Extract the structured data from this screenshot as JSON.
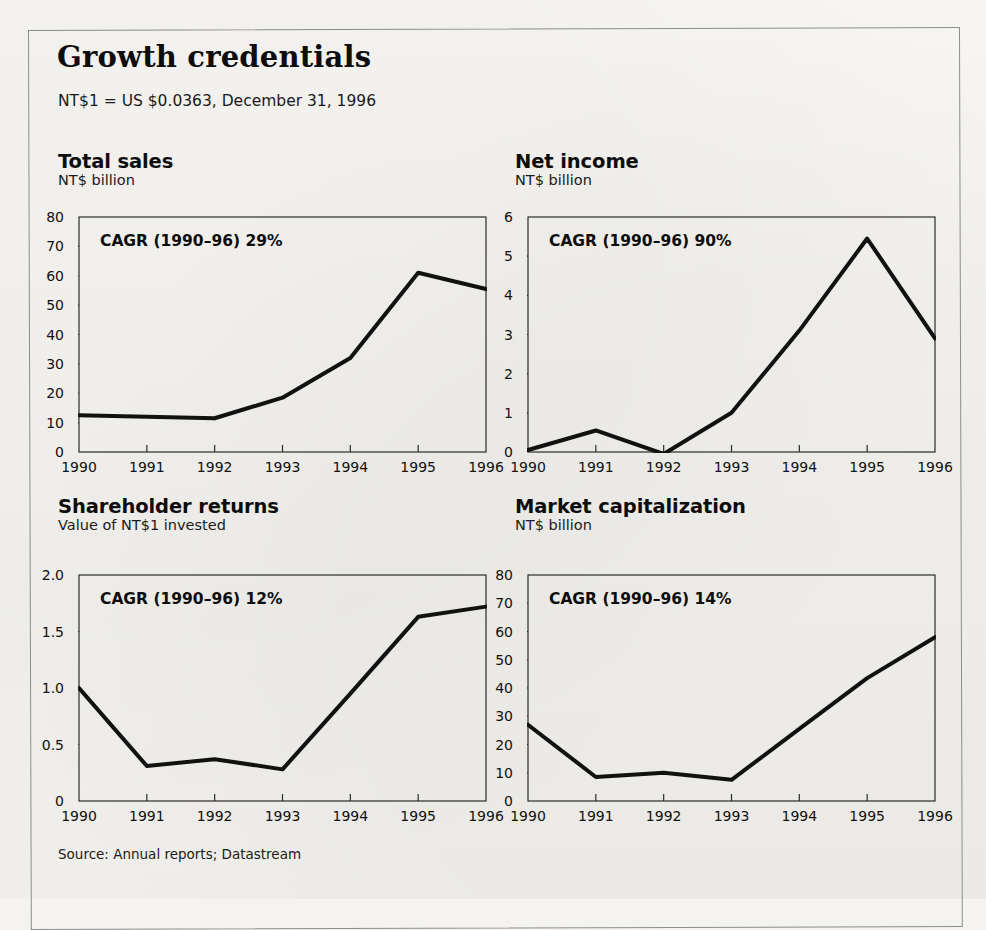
{
  "exhibit": {
    "title": "Growth credentials",
    "note": "NT$1 = US $0.0363, December 31, 1996",
    "source": "Source: Annual reports; Datastream",
    "frame_color": "#8d8d8d",
    "line_color": "#111111",
    "paper_color": "#f4f3f0"
  },
  "chart_data": [
    {
      "type": "line",
      "title": "Total sales",
      "subtitle": "NT$ billion",
      "annotation": "CAGR (1990–96) 29%",
      "xlabel": "",
      "ylabel": "NT$ billion",
      "categories": [
        "1990",
        "1991",
        "1992",
        "1993",
        "1994",
        "1995",
        "1996"
      ],
      "x": [
        1990,
        1991,
        1992,
        1993,
        1994,
        1995,
        1996
      ],
      "values": [
        12.5,
        12.0,
        11.5,
        18.5,
        32.0,
        61.0,
        55.5
      ],
      "ylim": [
        0,
        80
      ],
      "yticks": [
        0,
        10,
        20,
        30,
        40,
        50,
        60,
        70,
        80
      ],
      "ytick_labels": [
        "0",
        "10",
        "20",
        "30",
        "40",
        "50",
        "60",
        "70",
        "80"
      ],
      "grid": false,
      "legend": "none"
    },
    {
      "type": "line",
      "title": "Net income",
      "subtitle": "NT$ billion",
      "annotation": "CAGR (1990–96) 90%",
      "xlabel": "",
      "ylabel": "NT$ billion",
      "categories": [
        "1990",
        "1991",
        "1992",
        "1993",
        "1994",
        "1995",
        "1996"
      ],
      "x": [
        1990,
        1991,
        1992,
        1993,
        1994,
        1995,
        1996
      ],
      "values": [
        0.05,
        0.55,
        -0.05,
        1.0,
        3.1,
        5.45,
        2.9
      ],
      "ylim": [
        0,
        6
      ],
      "yticks": [
        0,
        1,
        2,
        3,
        4,
        5,
        6
      ],
      "ytick_labels": [
        "0",
        "1",
        "2",
        "3",
        "4",
        "5",
        "6"
      ],
      "grid": false,
      "legend": "none"
    },
    {
      "type": "line",
      "title": "Shareholder returns",
      "subtitle": "Value of NT$1 invested",
      "annotation": "CAGR (1990–96) 12%",
      "xlabel": "",
      "ylabel": "Value of NT$1 invested",
      "categories": [
        "1990",
        "1991",
        "1992",
        "1993",
        "1994",
        "1995",
        "1996"
      ],
      "x": [
        1990,
        1991,
        1992,
        1993,
        1994,
        1995,
        1996
      ],
      "values": [
        1.0,
        0.31,
        0.37,
        0.28,
        0.95,
        1.63,
        1.72
      ],
      "ylim": [
        0,
        2.0
      ],
      "yticks": [
        0,
        0.5,
        1.0,
        1.5,
        2.0
      ],
      "ytick_labels": [
        "0",
        "0.5",
        "1.0",
        "1.5",
        "2.0"
      ],
      "grid": false,
      "legend": "none"
    },
    {
      "type": "line",
      "title": "Market capitalization",
      "subtitle": "NT$ billion",
      "annotation": "CAGR (1990–96) 14%",
      "xlabel": "",
      "ylabel": "NT$ billion",
      "categories": [
        "1990",
        "1991",
        "1992",
        "1993",
        "1994",
        "1995",
        "1996"
      ],
      "x": [
        1990,
        1991,
        1992,
        1993,
        1994,
        1995,
        1996
      ],
      "values": [
        27.0,
        8.5,
        10.0,
        7.5,
        25.5,
        43.5,
        58.0
      ],
      "ylim": [
        0,
        80
      ],
      "yticks": [
        0,
        10,
        20,
        30,
        40,
        50,
        60,
        70,
        80
      ],
      "ytick_labels": [
        "0",
        "10",
        "20",
        "30",
        "40",
        "50",
        "60",
        "70",
        "80"
      ],
      "grid": false,
      "legend": "none"
    }
  ],
  "layout": {
    "panels": [
      {
        "left": 58,
        "top": 152,
        "plot_left": 78,
        "plot_top": 216,
        "plot_w": 407,
        "plot_h": 235,
        "cagr_left": 22,
        "cagr_top": 16
      },
      {
        "left": 515,
        "top": 152,
        "plot_left": 527,
        "plot_top": 216,
        "plot_w": 407,
        "plot_h": 235,
        "cagr_left": 22,
        "cagr_top": 16
      },
      {
        "left": 58,
        "top": 497,
        "plot_left": 78,
        "plot_top": 574,
        "plot_w": 407,
        "plot_h": 226,
        "cagr_left": 22,
        "cagr_top": 16
      },
      {
        "left": 515,
        "top": 497,
        "plot_left": 527,
        "plot_top": 574,
        "plot_w": 407,
        "plot_h": 226,
        "cagr_left": 22,
        "cagr_top": 16
      }
    ]
  }
}
